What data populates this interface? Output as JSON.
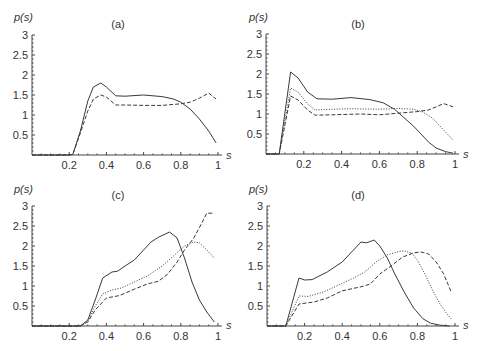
{
  "chart_data": [
    {
      "type": "line",
      "title": "(a)",
      "xlabel": "s",
      "ylabel": "p(s)",
      "xlim": [
        0,
        1
      ],
      "ylim": [
        0,
        3
      ],
      "xticks": [
        "0.2",
        "0.4",
        "0.6",
        "0.8",
        "1"
      ],
      "yticks": [
        "0.5",
        "1",
        "1.5",
        "2",
        "2.5",
        "3"
      ],
      "grid": false,
      "series": [
        {
          "name": "solid",
          "style": "solid",
          "x": [
            0,
            0.2,
            0.22,
            0.26,
            0.3,
            0.33,
            0.37,
            0.4,
            0.45,
            0.5,
            0.6,
            0.7,
            0.76,
            0.8,
            0.85,
            0.9,
            0.95,
            0.99
          ],
          "y": [
            0,
            0,
            0.02,
            0.6,
            1.35,
            1.7,
            1.8,
            1.7,
            1.48,
            1.47,
            1.5,
            1.46,
            1.4,
            1.32,
            1.15,
            0.9,
            0.6,
            0.3
          ]
        },
        {
          "name": "dashed",
          "style": "dashed",
          "x": [
            0,
            0.2,
            0.22,
            0.26,
            0.3,
            0.33,
            0.37,
            0.4,
            0.45,
            0.5,
            0.6,
            0.7,
            0.8,
            0.85,
            0.9,
            0.95,
            0.99
          ],
          "y": [
            0,
            0,
            0.02,
            0.55,
            1.1,
            1.4,
            1.5,
            1.45,
            1.25,
            1.25,
            1.24,
            1.24,
            1.28,
            1.32,
            1.42,
            1.55,
            1.4
          ]
        }
      ]
    },
    {
      "type": "line",
      "title": "(b)",
      "xlabel": "s",
      "ylabel": "p(s)",
      "xlim": [
        0,
        1
      ],
      "ylim": [
        0,
        3
      ],
      "xticks": [
        "0.2",
        "0.4",
        "0.6",
        "0.8",
        "1"
      ],
      "yticks": [
        "0.5",
        "1",
        "1.5",
        "2",
        "2.5",
        "3"
      ],
      "grid": false,
      "series": [
        {
          "name": "solid",
          "style": "solid",
          "x": [
            0,
            0.07,
            0.13,
            0.17,
            0.22,
            0.27,
            0.35,
            0.45,
            0.55,
            0.62,
            0.68,
            0.72,
            0.78,
            0.82,
            0.86,
            0.9,
            0.95,
            0.99
          ],
          "y": [
            0,
            0,
            2.05,
            1.9,
            1.55,
            1.38,
            1.37,
            1.41,
            1.36,
            1.28,
            1.12,
            0.95,
            0.7,
            0.5,
            0.3,
            0.15,
            0.06,
            0.02
          ]
        },
        {
          "name": "dotted",
          "style": "dotted",
          "x": [
            0,
            0.07,
            0.13,
            0.17,
            0.22,
            0.26,
            0.35,
            0.45,
            0.6,
            0.7,
            0.78,
            0.83,
            0.88,
            0.92,
            0.96,
            0.99
          ],
          "y": [
            0,
            0,
            1.65,
            1.55,
            1.25,
            1.1,
            1.12,
            1.13,
            1.12,
            1.14,
            1.12,
            1.05,
            0.9,
            0.7,
            0.5,
            0.35
          ]
        },
        {
          "name": "dashed",
          "style": "dashed",
          "x": [
            0,
            0.07,
            0.13,
            0.17,
            0.22,
            0.26,
            0.35,
            0.5,
            0.6,
            0.7,
            0.8,
            0.86,
            0.9,
            0.94,
            0.99
          ],
          "y": [
            0,
            0,
            1.45,
            1.35,
            1.1,
            0.97,
            0.98,
            1.0,
            0.98,
            1.02,
            1.06,
            1.1,
            1.18,
            1.26,
            1.18
          ]
        }
      ]
    },
    {
      "type": "line",
      "title": "(c)",
      "xlabel": "s",
      "ylabel": "p(s)",
      "xlim": [
        0,
        1
      ],
      "ylim": [
        0,
        3
      ],
      "xticks": [
        "0.2",
        "0.4",
        "0.6",
        "0.8",
        "1"
      ],
      "yticks": [
        "0.5",
        "1",
        "1.5",
        "2",
        "2.5",
        "3"
      ],
      "grid": false,
      "series": [
        {
          "name": "solid",
          "style": "solid",
          "x": [
            0,
            0.26,
            0.3,
            0.34,
            0.38,
            0.43,
            0.46,
            0.5,
            0.55,
            0.6,
            0.64,
            0.68,
            0.74,
            0.78,
            0.82,
            0.86,
            0.9,
            0.94,
            0.98
          ],
          "y": [
            0,
            0,
            0.15,
            0.65,
            1.2,
            1.35,
            1.37,
            1.5,
            1.65,
            1.9,
            2.1,
            2.22,
            2.35,
            2.2,
            1.7,
            1.1,
            0.65,
            0.35,
            0.1
          ]
        },
        {
          "name": "dotted",
          "style": "dotted",
          "x": [
            0,
            0.26,
            0.3,
            0.34,
            0.38,
            0.43,
            0.48,
            0.55,
            0.62,
            0.7,
            0.76,
            0.82,
            0.87,
            0.9,
            0.94,
            0.98
          ],
          "y": [
            0,
            0,
            0.12,
            0.5,
            0.8,
            0.9,
            0.95,
            1.1,
            1.25,
            1.5,
            1.75,
            2.0,
            2.1,
            2.08,
            1.9,
            1.7
          ]
        },
        {
          "name": "dashed",
          "style": "dashed",
          "x": [
            0,
            0.26,
            0.3,
            0.34,
            0.4,
            0.47,
            0.55,
            0.62,
            0.68,
            0.73,
            0.78,
            0.82,
            0.87,
            0.91,
            0.94,
            0.98
          ],
          "y": [
            0,
            0,
            0.1,
            0.4,
            0.7,
            0.76,
            0.92,
            1.05,
            1.12,
            1.3,
            1.6,
            1.9,
            2.2,
            2.55,
            2.82,
            2.82
          ]
        }
      ]
    },
    {
      "type": "line",
      "title": "(d)",
      "xlabel": "s",
      "ylabel": "p(s)",
      "xlim": [
        0,
        1
      ],
      "ylim": [
        0,
        3
      ],
      "xticks": [
        "0.2",
        "0.4",
        "0.6",
        "0.8",
        "1"
      ],
      "yticks": [
        "0.5",
        "1",
        "1.5",
        "2",
        "2.5",
        "3"
      ],
      "grid": false,
      "series": [
        {
          "name": "solid",
          "style": "solid",
          "x": [
            0,
            0.1,
            0.17,
            0.2,
            0.24,
            0.32,
            0.4,
            0.46,
            0.5,
            0.53,
            0.57,
            0.6,
            0.64,
            0.68,
            0.73,
            0.78,
            0.83,
            0.87,
            0.92,
            0.97
          ],
          "y": [
            0,
            0,
            1.2,
            1.15,
            1.16,
            1.35,
            1.6,
            1.9,
            2.1,
            2.08,
            2.15,
            2.0,
            1.7,
            1.3,
            0.85,
            0.45,
            0.18,
            0.07,
            0.02,
            0.0
          ]
        },
        {
          "name": "dotted",
          "style": "dotted",
          "x": [
            0,
            0.1,
            0.17,
            0.22,
            0.3,
            0.38,
            0.46,
            0.52,
            0.58,
            0.64,
            0.7,
            0.73,
            0.77,
            0.8,
            0.84,
            0.88,
            0.92,
            0.95,
            0.98
          ],
          "y": [
            0,
            0,
            0.75,
            0.74,
            0.85,
            1.02,
            1.2,
            1.35,
            1.6,
            1.78,
            1.86,
            1.88,
            1.82,
            1.65,
            1.3,
            0.9,
            0.55,
            0.35,
            0.18
          ]
        },
        {
          "name": "dashed",
          "style": "dashed",
          "x": [
            0,
            0.1,
            0.17,
            0.25,
            0.32,
            0.4,
            0.5,
            0.55,
            0.6,
            0.66,
            0.72,
            0.78,
            0.82,
            0.86,
            0.9,
            0.94,
            0.98
          ],
          "y": [
            0,
            0,
            0.55,
            0.6,
            0.7,
            0.88,
            0.98,
            1.05,
            1.3,
            1.5,
            1.72,
            1.83,
            1.85,
            1.8,
            1.6,
            1.3,
            0.85
          ]
        }
      ]
    }
  ],
  "panels": [
    {
      "title": "(a)",
      "ylabel": "p(s)",
      "xlabel": "s"
    },
    {
      "title": "(b)",
      "ylabel": "p(s)",
      "xlabel": "s"
    },
    {
      "title": "(c)",
      "ylabel": "p(s)",
      "xlabel": "s"
    },
    {
      "title": "(d)",
      "ylabel": "p(s)",
      "xlabel": "s"
    }
  ]
}
